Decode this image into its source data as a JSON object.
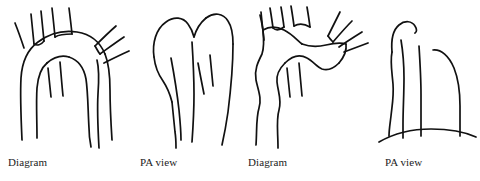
{
  "figure": {
    "background_color": "#ffffff",
    "ink_color": "#111111",
    "caption_color": "#1c1c1c",
    "panels": [
      {
        "id": "panel-1",
        "caption": "Diagram",
        "art_name": "aortic-arch-diagram-normal",
        "caption_x": 8,
        "caption_y": 156
      },
      {
        "id": "panel-2",
        "caption": "PA view",
        "art_name": "aortic-arch-pa-view-normal",
        "caption_x": 140,
        "caption_y": 156
      },
      {
        "id": "panel-3",
        "caption": "Diagram",
        "art_name": "aortic-arch-diagram-variant",
        "caption_x": 248,
        "caption_y": 156
      },
      {
        "id": "panel-4",
        "caption": "PA view",
        "art_name": "aortic-arch-pa-view-variant",
        "caption_x": 385,
        "caption_y": 156
      }
    ]
  }
}
